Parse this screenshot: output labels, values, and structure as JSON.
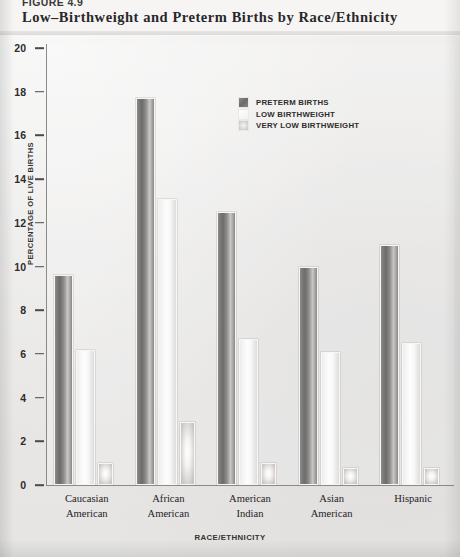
{
  "header": {
    "figure_number": "FIGURE 4.9",
    "title": "Low–Birthweight and Preterm Births by Race/Ethnicity"
  },
  "legend": {
    "position": "inside-top-center",
    "items": [
      {
        "label": "PRETERM BIRTHS",
        "swatch": "dark-gradient-swatch",
        "color": "#6e6c6a"
      },
      {
        "label": "LOW BIRTHWEIGHT",
        "swatch": "white-swatch",
        "color": "#fdfdfd"
      },
      {
        "label": "VERY LOW BIRTHWEIGHT",
        "swatch": "light-gray-swatch",
        "color": "#cbc8c5"
      }
    ]
  },
  "chart_data": {
    "type": "bar",
    "title": "Low–Birthweight and Preterm Births by Race/Ethnicity",
    "subtitle": "",
    "xlabel": "RACE/ETHNICITY",
    "ylabel": "PERCENTAGE OF LIVE BIRTHS",
    "ylim": [
      0,
      20
    ],
    "ytick_step": 2,
    "yticks": [
      0,
      2,
      4,
      6,
      8,
      10,
      12,
      14,
      16,
      18,
      20
    ],
    "ytick_labels": [
      "0",
      "2",
      "4",
      "6",
      "8",
      "10",
      "12",
      "14",
      "16",
      "18",
      "20"
    ],
    "grid": false,
    "categories": [
      "Caucasian American",
      "African American",
      "American Indian",
      "Asian American",
      "Hispanic"
    ],
    "category_lines": [
      [
        "Caucasian",
        "American"
      ],
      [
        "African",
        "American"
      ],
      [
        "American",
        "Indian"
      ],
      [
        "Asian",
        "American"
      ],
      [
        "Hispanic",
        ""
      ]
    ],
    "series": [
      {
        "name": "PRETERM BIRTHS",
        "color": "#6e6c6a",
        "values": [
          9.6,
          17.7,
          12.5,
          10.0,
          11.0
        ]
      },
      {
        "name": "LOW BIRTHWEIGHT",
        "color": "#fdfdfd",
        "values": [
          6.2,
          13.1,
          6.7,
          6.1,
          6.5
        ]
      },
      {
        "name": "VERY LOW BIRTHWEIGHT",
        "color": "#cbc8c5",
        "values": [
          1.0,
          2.9,
          1.0,
          0.8,
          0.8
        ]
      }
    ]
  }
}
